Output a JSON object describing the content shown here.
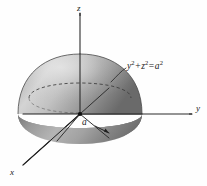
{
  "figure": {
    "type": "3d-solid-diagram",
    "background_color": "#fefefe",
    "ink_color": "#1a1a1a",
    "surface_light_color": "#d8d8d8",
    "surface_mid_color": "#9a9a9a",
    "surface_dark_color": "#6d6d6d",
    "surface_base_color": "#8c8c8c",
    "axes": [
      {
        "id": "z",
        "label": "z",
        "direction": "up",
        "tip_x": 80,
        "tip_y": 12,
        "origin_x": 80,
        "origin_y": 114
      },
      {
        "id": "y",
        "label": "y",
        "direction": "right",
        "tip_x": 193,
        "tip_y": 114,
        "origin_x": 80,
        "origin_y": 114
      },
      {
        "id": "x",
        "label": "x",
        "direction": "down-left-front",
        "tip_x": 22,
        "tip_y": 166,
        "origin_x": 80,
        "origin_y": 114
      }
    ],
    "annotations": [
      {
        "id": "surface-equation",
        "text_plain": "y2 + z2 = a2",
        "parts": [
          {
            "base": "y",
            "exponent": "2"
          },
          {
            "operator": "+"
          },
          {
            "base": "z",
            "exponent": "2"
          },
          {
            "operator": "="
          },
          {
            "base": "a",
            "exponent": "2"
          }
        ],
        "leader_from_x": 112,
        "leader_from_y": 80,
        "leader_to_x": 126,
        "leader_to_y": 68
      },
      {
        "id": "radius",
        "text_plain": "a",
        "arrow_from_x": 97,
        "arrow_from_y": 126,
        "arrow_to_x": 110,
        "arrow_to_y": 132
      }
    ],
    "origin_dot": {
      "x": 80,
      "y": 114,
      "r": 2.1
    },
    "hidden_rim": {
      "style": "dashed",
      "cx": 80,
      "cy": 98,
      "rx": 51,
      "ry": 14
    },
    "dome": {
      "apex_x": 80,
      "apex_y": 54,
      "half_width": 62,
      "rim_y": 114,
      "base_bottom_y": 142
    }
  }
}
